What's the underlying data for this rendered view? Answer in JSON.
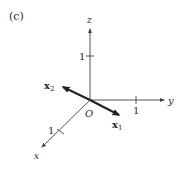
{
  "panel_label": "(c)",
  "origin_label": "O",
  "axes": {
    "z": {
      "label": "z",
      "tick_label": "1"
    },
    "y": {
      "label": "y",
      "tick_label": "1"
    },
    "x": {
      "label": "x",
      "tick_label": "1"
    }
  },
  "vectors": {
    "x1": {
      "label_main": "x",
      "label_sub": "1"
    },
    "x2": {
      "label_main": "x",
      "label_sub": "2"
    }
  },
  "colors": {
    "axis": "#555555",
    "vector": "#222222",
    "text": "#2b2b2b"
  }
}
